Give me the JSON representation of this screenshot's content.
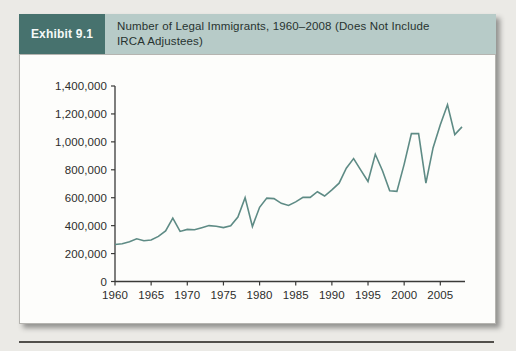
{
  "header": {
    "exhibit_label": "Exhibit 9.1",
    "title_line1": "Number of Legal Immigrants, 1960–2008 (Does Not Include",
    "title_line2": "IRCA Adjustees)"
  },
  "colors": {
    "exhibit_tab_bg": "#47726e",
    "exhibit_tab_text": "#f6f9f8",
    "exhibit_band_bg": "#b7cbc8",
    "exhibit_band_text": "#273330",
    "page_bg": "#ebeae6",
    "panel_bg": "#fdfdfb",
    "panel_border": "#b5b4b0",
    "axis": "#3a3a38",
    "tick_label": "#2d2d2b",
    "line": "#5e8b85",
    "bottom_rule": "#514f4b"
  },
  "chart_data": {
    "type": "line",
    "title": "Number of Legal Immigrants, 1960–2008 (Does Not Include IRCA Adjustees)",
    "xlabel": "",
    "ylabel": "",
    "xlim": [
      1960,
      2008
    ],
    "ylim": [
      0,
      1400000
    ],
    "grid": false,
    "legend": "none",
    "xticks": [
      1960,
      1965,
      1970,
      1975,
      1980,
      1985,
      1990,
      1995,
      2000,
      2005
    ],
    "xtick_labels": [
      "1960",
      "1965",
      "1970",
      "1975",
      "1980",
      "1985",
      "1990",
      "1995",
      "2000",
      "2005"
    ],
    "yticks": [
      0,
      200000,
      400000,
      600000,
      800000,
      1000000,
      1200000,
      1400000
    ],
    "ytick_labels": [
      "0",
      "200,000",
      "400,000",
      "600,000",
      "800,000",
      "1,000,000",
      "1,200,000",
      "1,400,000"
    ],
    "series": [
      {
        "name": "Legal immigrants (excluding IRCA adjustees)",
        "x": [
          1960,
          1961,
          1962,
          1963,
          1964,
          1965,
          1966,
          1967,
          1968,
          1969,
          1970,
          1971,
          1972,
          1973,
          1974,
          1975,
          1976,
          1977,
          1978,
          1979,
          1980,
          1981,
          1982,
          1983,
          1984,
          1985,
          1986,
          1987,
          1988,
          1989,
          1990,
          1991,
          1992,
          1993,
          1994,
          1995,
          1996,
          1997,
          1998,
          1999,
          2000,
          2001,
          2002,
          2003,
          2004,
          2005,
          2006,
          2007,
          2008
        ],
        "y": [
          265000,
          271000,
          284000,
          306000,
          292000,
          297000,
          323000,
          362000,
          454000,
          359000,
          373000,
          370000,
          385000,
          400000,
          395000,
          386000,
          399000,
          462000,
          601000,
          394000,
          531000,
          597000,
          594000,
          560000,
          544000,
          570000,
          602000,
          602000,
          643000,
          612000,
          656000,
          704000,
          811000,
          880000,
          798000,
          716000,
          911000,
          793000,
          650000,
          645000,
          841000,
          1059000,
          1059000,
          704000,
          958000,
          1122000,
          1266000,
          1052000,
          1107000
        ]
      }
    ]
  }
}
